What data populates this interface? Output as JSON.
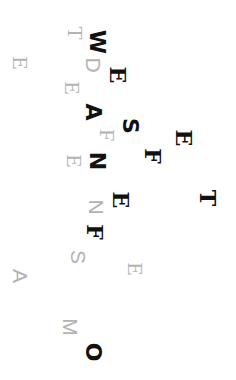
{
  "letters": [
    {
      "char": "T",
      "x": 75,
      "y": 33,
      "style": "serif-gray"
    },
    {
      "char": "W",
      "x": 97,
      "y": 42,
      "style": "black"
    },
    {
      "char": "E",
      "x": 20,
      "y": 63,
      "style": "serif-gray"
    },
    {
      "char": "D",
      "x": 93,
      "y": 65,
      "style": "gray"
    },
    {
      "char": "E",
      "x": 118,
      "y": 75,
      "style": "serif-black"
    },
    {
      "char": "E",
      "x": 72,
      "y": 88,
      "style": "serif-gray"
    },
    {
      "char": "A",
      "x": 93,
      "y": 112,
      "style": "black"
    },
    {
      "char": "S",
      "x": 130,
      "y": 126,
      "style": "black"
    },
    {
      "char": "F",
      "x": 107,
      "y": 135,
      "style": "serif-gray"
    },
    {
      "char": "E",
      "x": 184,
      "y": 138,
      "style": "serif-black"
    },
    {
      "char": "F",
      "x": 153,
      "y": 156,
      "style": "serif-black"
    },
    {
      "char": "E",
      "x": 74,
      "y": 161,
      "style": "serif-gray"
    },
    {
      "char": "N",
      "x": 97,
      "y": 161,
      "style": "black"
    },
    {
      "char": "E",
      "x": 121,
      "y": 200,
      "style": "serif-black"
    },
    {
      "char": "T",
      "x": 208,
      "y": 198,
      "style": "serif-black"
    },
    {
      "char": "N",
      "x": 96,
      "y": 207,
      "style": "gray"
    },
    {
      "char": "F",
      "x": 95,
      "y": 232,
      "style": "serif-black"
    },
    {
      "char": "S",
      "x": 78,
      "y": 257,
      "style": "gray"
    },
    {
      "char": "E",
      "x": 135,
      "y": 269,
      "style": "serif-gray"
    },
    {
      "char": "A",
      "x": 20,
      "y": 276,
      "style": "gray"
    },
    {
      "char": "M",
      "x": 70,
      "y": 327,
      "style": "gray"
    },
    {
      "char": "O",
      "x": 93,
      "y": 352,
      "style": "black"
    }
  ]
}
